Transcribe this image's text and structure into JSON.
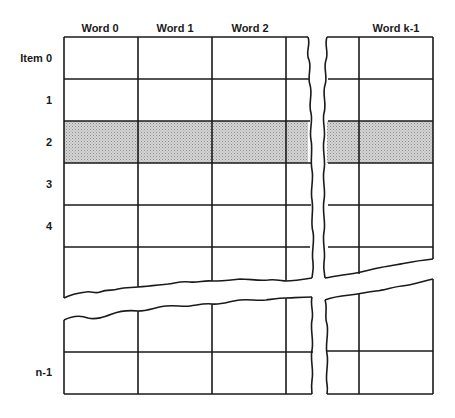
{
  "diagram": {
    "type": "memory-array-grid",
    "column_headers": [
      {
        "label": "Word 0",
        "x": 100
      },
      {
        "label": "Word 1",
        "x": 175
      },
      {
        "label": "Word 2",
        "x": 250
      },
      {
        "label": "Word k-1",
        "x": 396
      }
    ],
    "row_labels": [
      {
        "label": "Item  0",
        "y": 58
      },
      {
        "label": "1",
        "y": 100
      },
      {
        "label": "2",
        "y": 142
      },
      {
        "label": "3",
        "y": 184
      },
      {
        "label": "4",
        "y": 226
      },
      {
        "label": "n-1",
        "y": 372
      }
    ],
    "highlighted_row": "2",
    "colors": {
      "line": "#1a1a1a",
      "shade": "#bdbdbd",
      "background": "#ffffff"
    }
  }
}
